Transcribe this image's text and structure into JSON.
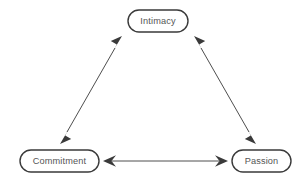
{
  "diagram": {
    "type": "triangle-relationship-diagram",
    "background_color": "#ffffff",
    "node_border_color": "#3a3a3a",
    "node_fill_color": "#ffffff",
    "node_text_color": "#555555",
    "arrow_color": "#3a3a3a",
    "nodes": [
      {
        "id": "intimacy",
        "label": "Intimacy",
        "x": 158,
        "y": 21,
        "width": 60,
        "height": 22
      },
      {
        "id": "commitment",
        "label": "Commitment",
        "x": 59.5,
        "y": 161,
        "width": 79,
        "height": 22
      },
      {
        "id": "passion",
        "label": "Passion",
        "x": 261.5,
        "y": 161,
        "width": 59,
        "height": 22
      }
    ],
    "connectors": [
      {
        "id": "commitment-intimacy",
        "from": "commitment",
        "to": "intimacy",
        "style": "double-headed-arrow",
        "x1": 60,
        "y1": 144,
        "x2": 122,
        "y2": 36
      },
      {
        "id": "intimacy-passion",
        "from": "intimacy",
        "to": "passion",
        "style": "double-headed-arrow",
        "x1": 194,
        "y1": 36,
        "x2": 256,
        "y2": 144
      },
      {
        "id": "commitment-passion",
        "from": "commitment",
        "to": "passion",
        "style": "double-headed-arrow",
        "x1": 103,
        "y1": 161,
        "x2": 228,
        "y2": 161
      }
    ]
  }
}
